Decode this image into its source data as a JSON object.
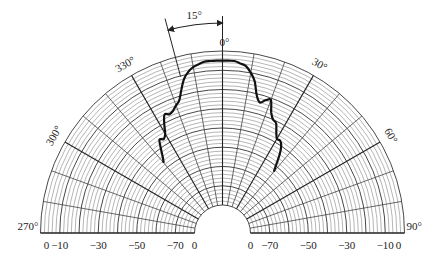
{
  "chart_data": {
    "type": "polar-line",
    "title": "",
    "angular_axis": {
      "range_deg": [
        -90,
        90
      ],
      "tick_labels": [
        "270°",
        "300°",
        "330°",
        "0°",
        "30°",
        "60°",
        "90°"
      ],
      "tick_angles": [
        -90,
        -60,
        -30,
        0,
        30,
        60,
        90
      ],
      "spoke_step_deg": 10
    },
    "radial_axis": {
      "unit": "dB",
      "tick_labels_left": [
        "0",
        "−10",
        "−30",
        "−50",
        "−70",
        "0"
      ],
      "tick_labels_right": [
        "0",
        "−70",
        "−50",
        "−30",
        "−10",
        "0"
      ],
      "range_db": [
        -80,
        0
      ],
      "ring_step_db": 2
    },
    "annotation": {
      "label": "15°",
      "from_deg": -15,
      "to_deg": 0
    },
    "series": [
      {
        "name": "radiation pattern",
        "angles_deg": [
          -40,
          -38,
          -36,
          -34,
          -32,
          -30,
          -28,
          -26,
          -24,
          -22,
          -20,
          -18,
          -16,
          -14,
          -12,
          -10,
          -8,
          -6,
          -4,
          -2,
          0,
          2,
          4,
          6,
          8,
          10,
          12,
          14,
          16,
          18,
          20,
          22,
          24,
          26,
          28,
          30,
          32,
          34,
          36,
          38,
          40
        ],
        "values_db": [
          -47,
          -44,
          -40,
          -36,
          -37,
          -35,
          -30,
          -26,
          -27,
          -26,
          -24,
          -22,
          -17,
          -12,
          -9,
          -7,
          -6,
          -5,
          -5,
          -5,
          -5,
          -5,
          -5,
          -6,
          -7,
          -10,
          -14,
          -21,
          -24,
          -22,
          -21,
          -27,
          -30,
          -31,
          -35,
          -38,
          -38,
          -40,
          -44,
          -49,
          -53
        ]
      }
    ]
  }
}
